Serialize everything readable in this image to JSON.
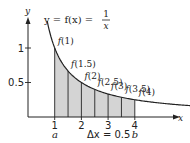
{
  "chart_data": {
    "type": "area",
    "title_parts": {
      "lhs": "y = f(x) =",
      "num": "1",
      "den": "x"
    },
    "function": "1/x",
    "xlabel": "x",
    "ylabel": "y",
    "xlim": [
      0,
      6.1
    ],
    "ylim": [
      0,
      1.5
    ],
    "x_ticks": [
      {
        "value": 1,
        "label": "1"
      },
      {
        "value": 2,
        "label": "2"
      },
      {
        "value": 3,
        "label": "3"
      },
      {
        "value": 4,
        "label": "4"
      }
    ],
    "y_ticks": [
      {
        "value": 0.5,
        "label": "0.5"
      },
      {
        "value": 1,
        "label": "1"
      }
    ],
    "interval": {
      "a": 1,
      "b": 4,
      "dx": 0.5
    },
    "interval_labels": {
      "a": "a",
      "b": "b",
      "dx": "Δx = 0.5"
    },
    "partition_points": [
      {
        "x": 1,
        "y": 1.0,
        "label": "f(1)"
      },
      {
        "x": 1.5,
        "y": 0.6667,
        "label": "f(1.5)"
      },
      {
        "x": 2,
        "y": 0.5,
        "label": "f(2)"
      },
      {
        "x": 2.5,
        "y": 0.4,
        "label": "f(2.5)"
      },
      {
        "x": 3,
        "y": 0.3333,
        "label": "f(3)"
      },
      {
        "x": 3.5,
        "y": 0.2857,
        "label": "f(3.5)"
      },
      {
        "x": 4,
        "y": 0.25,
        "label": "f(4)"
      }
    ],
    "curve_x_range": [
      0.72,
      6.1
    ],
    "grid": false,
    "colors": {
      "fill": "#d4d4d4",
      "curve": "#222222",
      "axis": "#222222"
    }
  }
}
